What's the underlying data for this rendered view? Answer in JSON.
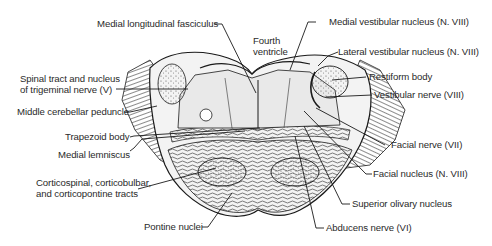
{
  "diagram": {
    "labels": {
      "medial_longitudinal_fasciculus": "Medial longitudinal fasciculus",
      "fourth_ventricle_line1": "Fourth",
      "fourth_ventricle_line2": "ventricle",
      "medial_vestibular_nucleus": "Medial vestibular nucleus (N. VIII)",
      "lateral_vestibular_nucleus": "Lateral vestibular nucleus (N. VIII)",
      "restiform_body": "Restiform body",
      "vestibular_nerve": "Vestibular nerve (VIII)",
      "spinal_tract_line1": "Spinal tract and nucleus",
      "spinal_tract_line2": "of trigeminal nerve (V)",
      "middle_cerebellar_peduncle": "Middle cerebellar peduncle",
      "trapezoid_body": "Trapezoid body",
      "medial_lemniscus": "Medial lemniscus",
      "corticospinal_line1": "Corticospinal, corticobulbar,",
      "corticospinal_line2": "and corticopontine tracts",
      "pontine_nuclei": "Pontine nuclei",
      "facial_nerve": "Facial nerve (VII)",
      "facial_nucleus": "Facial nucleus (N. VIII)",
      "superior_olivary_nucleus": "Superior olivary nucleus",
      "abducens_nerve": "Abducens nerve (VI)"
    },
    "colors": {
      "ink": "#1a1a1a",
      "label_text": "#2a2a2a",
      "tissue_light": "#ececec",
      "tissue_mid": "#bdbdbd",
      "background": "#ffffff"
    }
  }
}
